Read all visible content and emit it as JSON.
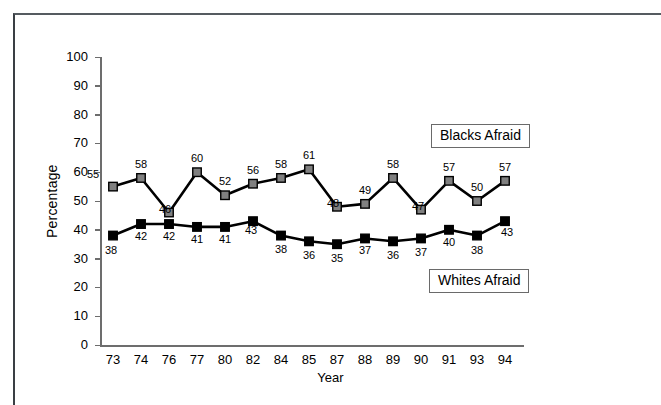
{
  "chart_data": {
    "type": "line",
    "title": "",
    "xlabel": "Year",
    "ylabel": "Percentage",
    "ylim": [
      0,
      100
    ],
    "ytick_step": 10,
    "yticks": [
      "0",
      "10",
      "20",
      "30",
      "40",
      "50",
      "60",
      "70",
      "80",
      "90",
      "100"
    ],
    "categories": [
      "73",
      "74",
      "76",
      "77",
      "80",
      "82",
      "84",
      "85",
      "87",
      "88",
      "89",
      "90",
      "91",
      "93",
      "94"
    ],
    "grid": false,
    "legend_position": "inline-boxes",
    "series": [
      {
        "name": "Blacks Afraid",
        "marker": "square",
        "marker_color": "#808080",
        "line_color": "#000000",
        "values": [
          55,
          58,
          46,
          60,
          52,
          56,
          58,
          61,
          48,
          49,
          58,
          47,
          57,
          50,
          57
        ],
        "labels": [
          "55",
          "58",
          "46",
          "60",
          "52",
          "56",
          "58",
          "61",
          "48",
          "49",
          "58",
          "47",
          "57",
          "50",
          "57"
        ]
      },
      {
        "name": "Whites Afraid",
        "marker": "square",
        "marker_color": "#000000",
        "line_color": "#000000",
        "values": [
          38,
          42,
          42,
          41,
          41,
          43,
          38,
          36,
          35,
          37,
          36,
          37,
          40,
          38,
          43
        ],
        "labels": [
          "38",
          "42",
          "42",
          "41",
          "41",
          "43",
          "38",
          "36",
          "35",
          "37",
          "36",
          "37",
          "40",
          "38",
          "43"
        ]
      }
    ]
  },
  "legend": {
    "blacks_label": "Blacks Afraid",
    "whites_label": "Whites Afraid"
  },
  "axes": {
    "y_title": "Percentage",
    "x_title": "Year"
  }
}
